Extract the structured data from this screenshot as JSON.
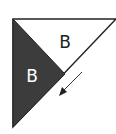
{
  "diagram": {
    "type": "paper-fold",
    "colors": {
      "background": "#ffffff",
      "outline": "#222222",
      "dark_fill": "#3c3c3c",
      "light_fill": "#ffffff",
      "label_on_light": "#222222",
      "label_on_dark": "#ffffff"
    },
    "regions": [
      {
        "id": "upper-triangle",
        "label": "B",
        "fill": "light"
      },
      {
        "id": "lower-triangle",
        "label": "B",
        "fill": "dark"
      }
    ],
    "arrow": {
      "direction": "down-left"
    }
  }
}
